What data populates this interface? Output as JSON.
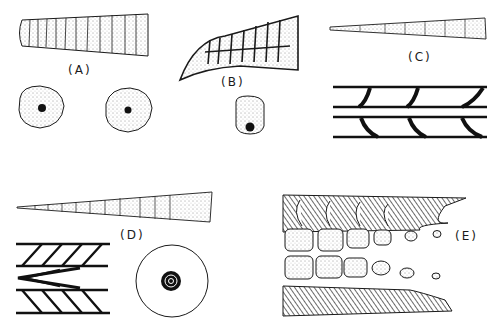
{
  "figure": {
    "panels": [
      {
        "id": "A",
        "label": "(A)",
        "description": "tapered segmented spine, two circular cross-sections with central dot"
      },
      {
        "id": "B",
        "label": "(B)",
        "description": "curved segmented spine with chambers, rounded-rectangle cross-section with basal dot"
      },
      {
        "id": "C",
        "label": "(C)",
        "description": "slender tapered spine, longitudinal section with curved septa"
      },
      {
        "id": "D",
        "label": "(D)",
        "description": "long tapered segmented spine, chevron longitudinal section, concentric circular cross-section"
      },
      {
        "id": "E",
        "label": "(E)",
        "description": "longitudinal section with hatched walls and stippled chambers"
      }
    ]
  },
  "colors": {
    "ink": "#1a1a1a",
    "paper": "#ffffff"
  }
}
